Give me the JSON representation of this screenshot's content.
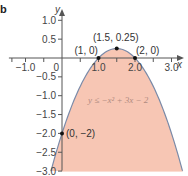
{
  "panel_label": "b",
  "colors": {
    "fill": "#f7c6b4",
    "curve": "#7a8aa8",
    "axis": "#555555",
    "point": "#111111"
  },
  "chart_data": {
    "type": "area",
    "title": "",
    "function": "y = -x^2 + 3x - 2",
    "inequality_label": "y ≤ −x² + 3x − 2",
    "xlabel": "x",
    "ylabel": "y",
    "xlim": [
      -1.4,
      3.3
    ],
    "ylim": [
      -3.0,
      1.2
    ],
    "x_ticks": [
      -1.0,
      0,
      1.0,
      2.0,
      3.0
    ],
    "x_tick_labels": [
      "−1.0",
      "0",
      "1.0",
      "2.0",
      "3.0"
    ],
    "y_ticks": [
      1.0,
      0.5,
      -0.5,
      -1.0,
      -1.5,
      -2.0,
      -2.5,
      -3.0
    ],
    "y_tick_labels": [
      "1.0",
      "0.5",
      "−0.5",
      "−1.0",
      "−1.5",
      "−2.0",
      "−2.5",
      "−3.0"
    ],
    "grid": false,
    "shaded_region": "below curve, down to y = -3.0",
    "points": [
      {
        "x": 1,
        "y": 0,
        "label": "(1, 0)"
      },
      {
        "x": 1.5,
        "y": 0.25,
        "label": "(1.5, 0.25)"
      },
      {
        "x": 2,
        "y": 0,
        "label": "(2, 0)"
      },
      {
        "x": 0,
        "y": -2,
        "label": "(0, −2)"
      }
    ]
  }
}
